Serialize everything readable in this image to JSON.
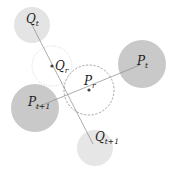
{
  "diagram": {
    "colors": {
      "light_circle": "#e4e4e4",
      "dark_circle": "#c9c9c9",
      "line": "#8a8a8a",
      "dashed_outline": "#8c8c8c",
      "dotted_outline": "#cfcfcf",
      "dot": "#444444",
      "text": "#222222"
    },
    "nodes": [
      {
        "id": "Q_t",
        "label": "Q",
        "subscript": "t",
        "cx": 32,
        "cy": 25,
        "r": 18,
        "style": "light"
      },
      {
        "id": "Q_r",
        "label": "Q",
        "subscript": "r",
        "cx": 52,
        "cy": 66,
        "r": 20,
        "style": "dotted"
      },
      {
        "id": "P_r",
        "label": "P",
        "subscript": "r",
        "cx": 89,
        "cy": 90,
        "r": 25,
        "style": "dashed"
      },
      {
        "id": "P_t",
        "label": "P",
        "subscript": "t",
        "cx": 142,
        "cy": 64,
        "r": 24,
        "style": "dark"
      },
      {
        "id": "P_t+1",
        "label": "P",
        "subscript": "t+1",
        "cx": 35,
        "cy": 108,
        "r": 24,
        "style": "dark"
      },
      {
        "id": "Q_t+1",
        "label": "Q",
        "subscript": "t+1",
        "cx": 95,
        "cy": 148,
        "r": 18,
        "style": "light"
      }
    ],
    "edges": [
      {
        "from": "Q_t",
        "to": "Q_t+1"
      },
      {
        "from": "P_t+1",
        "to": "P_t"
      }
    ],
    "labels": {
      "q_t": {
        "main": "Q",
        "sub": "t"
      },
      "q_r": {
        "main": "Q",
        "sub": "r"
      },
      "p_r": {
        "main": "P",
        "sub": "r"
      },
      "p_t": {
        "main": "P",
        "sub": "t"
      },
      "p_t1": {
        "main": "P",
        "sub": "t+1"
      },
      "q_t1": {
        "main": "Q",
        "sub": "t+1"
      }
    }
  }
}
